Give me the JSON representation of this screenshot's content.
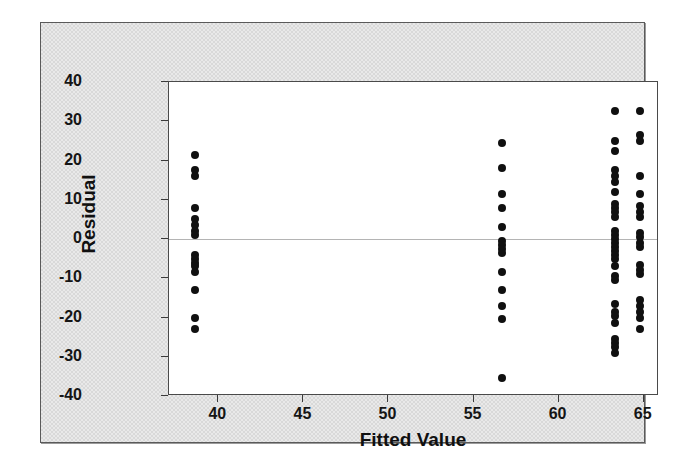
{
  "chart_data": {
    "type": "scatter",
    "title": "",
    "xlabel": "Fitted Value",
    "ylabel": "Residual",
    "xlim": [
      37.1,
      65.9
    ],
    "ylim": [
      -40,
      40
    ],
    "xticks": [
      40,
      45,
      50,
      55,
      60,
      65
    ],
    "yticks": [
      40,
      30,
      20,
      10,
      0,
      -10,
      -20,
      -30,
      -40
    ],
    "grid": false,
    "legend": null,
    "reference_line_y": 0,
    "groups": [
      {
        "name": "group-1",
        "x": 38.6,
        "y": [
          21.5,
          17.5,
          16.0,
          8.0,
          5.0,
          3.5,
          2.0,
          1.0,
          -4.0,
          -5.0,
          -6.0,
          -7.0,
          -8.5,
          -13.0,
          -20.0,
          -23.0
        ]
      },
      {
        "name": "group-2",
        "x": 56.7,
        "y": [
          24.5,
          18.0,
          11.5,
          8.0,
          3.0,
          -0.5,
          -1.5,
          -2.5,
          -3.5,
          -8.5,
          -13.0,
          -17.0,
          -20.5,
          -35.5
        ]
      },
      {
        "name": "group-3a",
        "x": 63.3,
        "y": [
          32.5,
          25.0,
          22.5,
          17.5,
          16.0,
          14.5,
          12.0,
          9.0,
          8.0,
          7.0,
          5.5,
          2.0,
          1.0,
          0.0,
          -1.0,
          -2.0,
          -3.0,
          -4.0,
          -5.0,
          -7.0,
          -9.5,
          -10.5,
          -16.5,
          -18.5,
          -19.5,
          -21.5,
          -25.5,
          -26.5,
          -27.5,
          -29.0
        ]
      },
      {
        "name": "group-3b",
        "x": 64.8,
        "y": [
          32.5,
          26.5,
          25.0,
          16.0,
          11.5,
          8.5,
          7.0,
          5.5,
          1.5,
          0.5,
          -1.0,
          -2.0,
          -6.5,
          -8.0,
          -9.0,
          -15.5,
          -17.0,
          -18.5,
          -20.0,
          -23.0
        ]
      }
    ]
  },
  "axes": {
    "y_title": "Residual",
    "x_title": "Fitted Value",
    "y_tick_labels": [
      "40",
      "30",
      "20",
      "10",
      "0",
      "-10",
      "-20",
      "-30",
      "-40"
    ],
    "x_tick_labels": [
      "40",
      "45",
      "50",
      "55",
      "60",
      "65"
    ]
  },
  "colors": {
    "point": "#101010",
    "panel_background": "#e9e9e9",
    "plot_background": "#ffffff",
    "axis_line": "#4a4a4a",
    "zero_line": "#b4b4b4",
    "text": "#101010"
  }
}
